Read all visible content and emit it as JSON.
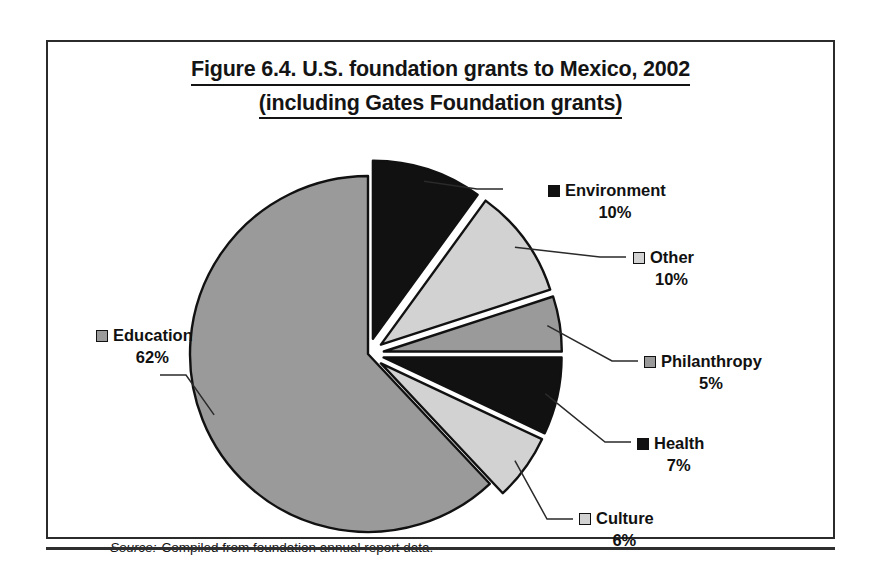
{
  "figure": {
    "title_line_1": "Figure 6.4. U.S. foundation grants to Mexico, 2002",
    "title_line_2": "(including Gates Foundation grants)",
    "source_label": "Source:",
    "source_text": "Compiled from foundation annual report data."
  },
  "labels": {
    "environment": {
      "name": "Environment",
      "pct": "10%"
    },
    "other": {
      "name": "Other",
      "pct": "10%"
    },
    "philanthropy": {
      "name": "Philanthropy",
      "pct": "5%"
    },
    "health": {
      "name": "Health",
      "pct": "7%"
    },
    "culture": {
      "name": "Culture",
      "pct": "6%"
    },
    "education": {
      "name": "Education",
      "pct": "62%"
    }
  },
  "chart_data": {
    "type": "pie",
    "title": "Figure 6.4. U.S. foundation grants to Mexico, 2002 (including Gates Foundation grants)",
    "xlabel": "",
    "ylabel": "",
    "grid": false,
    "legend": "none",
    "labels_position": "outside-with-leader-lines",
    "start_angle_deg": 0,
    "direction": "clockwise",
    "exploded": [
      "Environment",
      "Other",
      "Philanthropy",
      "Health",
      "Culture"
    ],
    "categories": [
      "Environment",
      "Other",
      "Philanthropy",
      "Health",
      "Culture",
      "Education"
    ],
    "values": [
      10,
      10,
      5,
      7,
      6,
      62
    ],
    "value_unit": "percent",
    "colors": [
      "#111111",
      "#d2d2d2",
      "#9a9a9a",
      "#111111",
      "#d2d2d2",
      "#9a9a9a"
    ],
    "slices": [
      {
        "label": "Environment",
        "value": 10,
        "display": "10%",
        "color": "#111111",
        "exploded": true
      },
      {
        "label": "Other",
        "value": 10,
        "display": "10%",
        "color": "#d2d2d2",
        "exploded": true
      },
      {
        "label": "Philanthropy",
        "value": 5,
        "display": "5%",
        "color": "#9a9a9a",
        "exploded": true
      },
      {
        "label": "Health",
        "value": 7,
        "display": "7%",
        "color": "#111111",
        "exploded": true
      },
      {
        "label": "Culture",
        "value": 6,
        "display": "6%",
        "color": "#d2d2d2",
        "exploded": true
      },
      {
        "label": "Education",
        "value": 62,
        "display": "62%",
        "color": "#9a9a9a",
        "exploded": false
      }
    ]
  },
  "palette": {
    "black": "#111111",
    "gray": "#9a9a9a",
    "light_gray": "#d2d2d2",
    "outline": "#111111",
    "frame": "#2b2b2b",
    "background": "#ffffff"
  }
}
